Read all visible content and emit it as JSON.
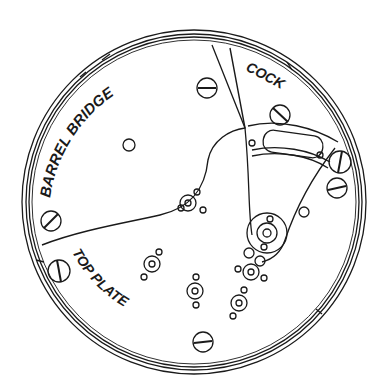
{
  "diagram": {
    "type": "watch movement top view (line drawing)",
    "labels": {
      "barrel_bridge": "BARREL BRIDGE",
      "cock": "COCK",
      "top_plate": "TOP PLATE"
    },
    "colors": {
      "line": "#1a1a1a",
      "background": "#ffffff"
    },
    "parts": [
      "outer case ring",
      "barrel bridge",
      "balance cock",
      "top plate",
      "jewel settings",
      "screws",
      "regulator"
    ]
  }
}
